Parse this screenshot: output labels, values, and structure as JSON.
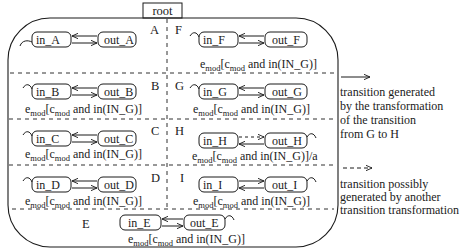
{
  "diagram": {
    "root_label": "root",
    "regions": [
      {
        "id": "A",
        "in": "in_A",
        "out": "out_A",
        "guard": "",
        "self_loop": "in",
        "in_arrow_dir": "left",
        "out_arrow_dir": "right"
      },
      {
        "id": "B",
        "in": "in_B",
        "out": "out_B",
        "guard": "and in(IN_G)]",
        "self_loop": "in"
      },
      {
        "id": "C",
        "in": "in_C",
        "out": "out_C",
        "guard": "and in(IN_G)]",
        "self_loop": "in"
      },
      {
        "id": "D",
        "in": "in_D",
        "out": "out_D",
        "guard": "and in(IN_G)]",
        "self_loop": "in"
      },
      {
        "id": "E",
        "in": "in_E",
        "out": "out_E",
        "guard": "and in(IN_G)]",
        "self_loop": "out"
      },
      {
        "id": "F",
        "in": "in_F",
        "out": "out_F",
        "guard": "and in(IN_G)]",
        "self_loop": "in"
      },
      {
        "id": "G",
        "in": "in_G",
        "out": "out_G",
        "guard": "and in(IN_G)]",
        "self_loop": "in"
      },
      {
        "id": "H",
        "in": "in_H",
        "out": "out_H",
        "guard": "and in(IN_G)]/a",
        "self_loop": "out"
      },
      {
        "id": "I",
        "in": "in_I",
        "out": "out_I",
        "guard": "and in(IN_G)]",
        "self_loop": "out"
      }
    ],
    "guard_prefix_e": "e",
    "guard_sub_mod": "mod",
    "guard_bracket": "[",
    "guard_prefix_c": "c"
  },
  "legend": {
    "solid": {
      "lines": [
        "transition generated",
        "by the transformation",
        "of the transition",
        "from G to H"
      ]
    },
    "dashed": {
      "lines": [
        "transition possibly",
        "generated by another",
        "transition transformation"
      ]
    }
  }
}
